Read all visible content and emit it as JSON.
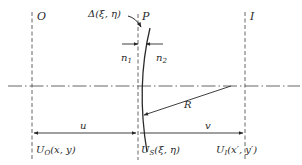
{
  "diagram": {
    "planes": {
      "object": {
        "label": "O",
        "field_label": "U",
        "field_sub": "O",
        "field_args": "(x, y)"
      },
      "surface": {
        "field_label": "U",
        "field_sub": "S",
        "field_args": "(ξ, η)"
      },
      "image": {
        "label": "I",
        "field_label": "U",
        "field_sub": "I",
        "field_args": "(x′, y′)"
      }
    },
    "surface_point": {
      "label": "P",
      "aberration_label": "Δ(ξ, η)"
    },
    "media": {
      "left": "n",
      "left_sub": "1",
      "right": "n",
      "right_sub": "2"
    },
    "radius_label": "R",
    "distances": {
      "object_to_surface": "u",
      "surface_to_image": "v"
    },
    "colors": {
      "stroke": "#2a2a2a",
      "dashed": "#555555",
      "background": "#ffffff"
    }
  }
}
